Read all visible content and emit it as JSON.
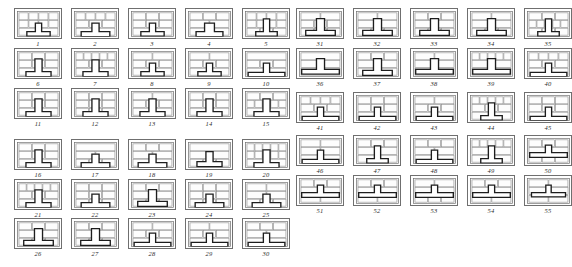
{
  "figure": {
    "total_patterns": 55,
    "panel_width_units": 48,
    "panel_height_units": 31,
    "colors": {
      "background": "#ffffff",
      "panel_border": "#6f6f6f",
      "brick_stroke": "#8a8a8a",
      "brick_fill": "#fdfdfd",
      "tee_stroke": "#1d1d1d",
      "tee_fill": "#ffffff",
      "caption": "#2b2b2b"
    },
    "groups": [
      {
        "name": "left-group",
        "columns": 5,
        "rows": 6,
        "first_label": "1",
        "last_label": "30",
        "captions": [
          "1",
          "2",
          "3",
          "4",
          "5",
          "6",
          "7",
          "8",
          "9",
          "10",
          "11",
          "12",
          "13",
          "14",
          "15",
          "16",
          "17",
          "18",
          "19",
          "20",
          "21",
          "22",
          "23",
          "24",
          "25",
          "26",
          "27",
          "28",
          "29",
          "30"
        ]
      },
      {
        "name": "right-group",
        "columns": 5,
        "rows": 5,
        "first_label": "31",
        "last_label": "55",
        "captions": [
          "31",
          "32",
          "33",
          "34",
          "35",
          "36",
          "37",
          "38",
          "39",
          "40",
          "41",
          "42",
          "43",
          "44",
          "45",
          "46",
          "47",
          "48",
          "49",
          "50",
          "51",
          "52",
          "53",
          "54",
          "55"
        ]
      }
    ],
    "patterns": [
      {
        "label": "1",
        "tee": "center-low-narrow",
        "courses": [
          "4-stretcher",
          "4-stretcher",
          "2-long"
        ]
      },
      {
        "label": "2",
        "tee": "center-low-wide",
        "courses": [
          "4-stretcher",
          "3-stretcher",
          "2-long"
        ]
      },
      {
        "label": "3",
        "tee": "center-low-narrow",
        "courses": [
          "3-long",
          "3-stretcher",
          "2-long"
        ]
      },
      {
        "label": "4",
        "tee": "center-wide-stem",
        "courses": [
          "3-long",
          "2-long",
          "2-long"
        ]
      },
      {
        "label": "5",
        "tee": "center-tall-narrow",
        "courses": [
          "4-stretcher",
          "4-stretcher",
          "3-stretcher"
        ]
      },
      {
        "label": "6",
        "tee": "center-tall-stem",
        "courses": [
          "3-stretcher",
          "3-stretcher",
          "2-long"
        ]
      },
      {
        "label": "7",
        "tee": "center-soldier",
        "courses": [
          "soldier-row",
          "3-stretcher",
          "2-long"
        ]
      },
      {
        "label": "8",
        "tee": "center-low-narrow",
        "courses": [
          "2-long",
          "3-long",
          "2-long"
        ]
      },
      {
        "label": "9",
        "tee": "center-low-narrow",
        "courses": [
          "2-long",
          "3-long",
          "2-long"
        ]
      },
      {
        "label": "10",
        "tee": "center-low-broad",
        "courses": [
          "1-full",
          "3-stretcher",
          "2-long"
        ]
      },
      {
        "label": "11",
        "tee": "center-tall-stem",
        "courses": [
          "3-stretcher",
          "3-stretcher",
          "2-long"
        ]
      },
      {
        "label": "12",
        "tee": "center-tall-stem",
        "courses": [
          "3-stretcher",
          "3-stretcher",
          "3-stretcher"
        ]
      },
      {
        "label": "13",
        "tee": "center-tall-stem",
        "courses": [
          "2-long",
          "3-stretcher",
          "2-long"
        ]
      },
      {
        "label": "14",
        "tee": "center-tall-stem",
        "courses": [
          "3-stretcher",
          "3-stretcher",
          "2-long"
        ]
      },
      {
        "label": "15",
        "tee": "center-tall-stem",
        "courses": [
          "3-stretcher",
          "soldier-row",
          "2-long"
        ]
      },
      {
        "label": "16",
        "tee": "center-tall-stem",
        "courses": [
          "3-stretcher",
          "3-stretcher",
          "2-long"
        ]
      },
      {
        "label": "17",
        "tee": "center-low-wide",
        "courses": [
          "1-full",
          "2-long",
          "3-stretcher"
        ]
      },
      {
        "label": "18",
        "tee": "center-low-wide",
        "courses": [
          "3-long",
          "2-long",
          "2-long"
        ]
      },
      {
        "label": "19",
        "tee": "center-mid-stem",
        "courses": [
          "1-full",
          "2-long",
          "3-stretcher"
        ]
      },
      {
        "label": "20",
        "tee": "center-tall-stem",
        "courses": [
          "soldier-row",
          "soldier-row",
          "2-long"
        ]
      },
      {
        "label": "21",
        "tee": "center-tall-stem",
        "courses": [
          "soldier-row",
          "3-stretcher",
          "2-long"
        ]
      },
      {
        "label": "22",
        "tee": "center-low-wide",
        "courses": [
          "3-stretcher",
          "3-long",
          "3-stretcher"
        ]
      },
      {
        "label": "23",
        "tee": "center-tall-wide",
        "courses": [
          "3-stretcher",
          "2-long",
          "3-stretcher"
        ]
      },
      {
        "label": "24",
        "tee": "center-low-wide",
        "courses": [
          "3-stretcher",
          "3-long",
          "3-stretcher"
        ]
      },
      {
        "label": "25",
        "tee": "center-low-wide",
        "courses": [
          "2-long",
          "2-long",
          "3-stretcher"
        ]
      },
      {
        "label": "26",
        "tee": "center-tall-wide",
        "courses": [
          "3-stretcher",
          "2-long",
          "3-stretcher"
        ]
      },
      {
        "label": "27",
        "tee": "center-tall-wide",
        "courses": [
          "3-stretcher",
          "2-long",
          "3-stretcher"
        ]
      },
      {
        "label": "28",
        "tee": "center-low-broad",
        "courses": [
          "2-long",
          "3-long",
          "1-full"
        ]
      },
      {
        "label": "29",
        "tee": "center-low-broad",
        "courses": [
          "2-long",
          "3-stretcher",
          "1-full"
        ]
      },
      {
        "label": "30",
        "tee": "center-low-broad",
        "courses": [
          "3-stretcher",
          "2-long",
          "1-full"
        ]
      },
      {
        "label": "31",
        "tee": "center-tall-wide",
        "courses": [
          "2-long",
          "3-long",
          "3-stretcher"
        ]
      },
      {
        "label": "32",
        "tee": "center-tall-wide",
        "courses": [
          "2-long",
          "2-long",
          "3-stretcher"
        ]
      },
      {
        "label": "33",
        "tee": "center-tall-wide",
        "courses": [
          "3-stretcher",
          "2-long",
          "3-stretcher"
        ]
      },
      {
        "label": "34",
        "tee": "center-tall-wide",
        "courses": [
          "2-long",
          "2-long",
          "3-stretcher"
        ]
      },
      {
        "label": "35",
        "tee": "center-tall-narrow",
        "courses": [
          "3-stretcher",
          "soldier-row",
          "3-stretcher"
        ]
      },
      {
        "label": "36",
        "tee": "center-tall-broad",
        "courses": [
          "1-full",
          "2-long",
          "1-full"
        ]
      },
      {
        "label": "37",
        "tee": "center-tall-wide",
        "courses": [
          "3-stretcher",
          "2-long",
          "1-full"
        ]
      },
      {
        "label": "38",
        "tee": "center-tall-broad",
        "courses": [
          "2-long",
          "1-full",
          "1-full"
        ]
      },
      {
        "label": "39",
        "tee": "center-tall-broad",
        "courses": [
          "soldier-row",
          "1-full",
          "1-full"
        ]
      },
      {
        "label": "40",
        "tee": "center-low-broad",
        "courses": [
          "4-stretcher",
          "3-stretcher",
          "1-full"
        ]
      },
      {
        "label": "41",
        "tee": "center-low-broad",
        "courses": [
          "4-stretcher",
          "3-stretcher",
          "1-full"
        ]
      },
      {
        "label": "42",
        "tee": "center-low-broad",
        "courses": [
          "3-stretcher",
          "3-stretcher",
          "1-full"
        ]
      },
      {
        "label": "43",
        "tee": "center-low-broad",
        "courses": [
          "2-long",
          "3-stretcher",
          "1-full"
        ]
      },
      {
        "label": "44",
        "tee": "center-tall-narrow",
        "courses": [
          "soldier-row",
          "3-stretcher",
          "1-full"
        ]
      },
      {
        "label": "45",
        "tee": "center-low-broad",
        "courses": [
          "3-long",
          "3-stretcher",
          "1-full"
        ]
      },
      {
        "label": "46",
        "tee": "center-low-broad",
        "courses": [
          "2-long",
          "2-long",
          "1-full"
        ]
      },
      {
        "label": "47",
        "tee": "center-tall-narrow",
        "courses": [
          "3-stretcher",
          "2-long",
          "1-full"
        ]
      },
      {
        "label": "48",
        "tee": "center-low-broad",
        "courses": [
          "3-stretcher",
          "2-long",
          "1-full"
        ]
      },
      {
        "label": "49",
        "tee": "center-tall-narrow",
        "courses": [
          "soldier-row",
          "2-long",
          "1-full"
        ]
      },
      {
        "label": "50",
        "tee": "center-mid-broad",
        "courses": [
          "3-stretcher",
          "1-full",
          "3-stretcher"
        ]
      },
      {
        "label": "51",
        "tee": "center-mid-broad",
        "courses": [
          "3-stretcher",
          "1-full",
          "2-long"
        ]
      },
      {
        "label": "52",
        "tee": "center-mid-broad",
        "courses": [
          "3-stretcher",
          "1-full",
          "2-long"
        ]
      },
      {
        "label": "53",
        "tee": "center-mid-broad",
        "courses": [
          "2-long",
          "1-full",
          "3-stretcher"
        ]
      },
      {
        "label": "54",
        "tee": "center-mid-broad",
        "courses": [
          "3-stretcher",
          "1-full",
          "2-long"
        ]
      },
      {
        "label": "55",
        "tee": "center-mid-narrow",
        "courses": [
          "2-long",
          "1-full",
          "2-long"
        ]
      }
    ]
  }
}
